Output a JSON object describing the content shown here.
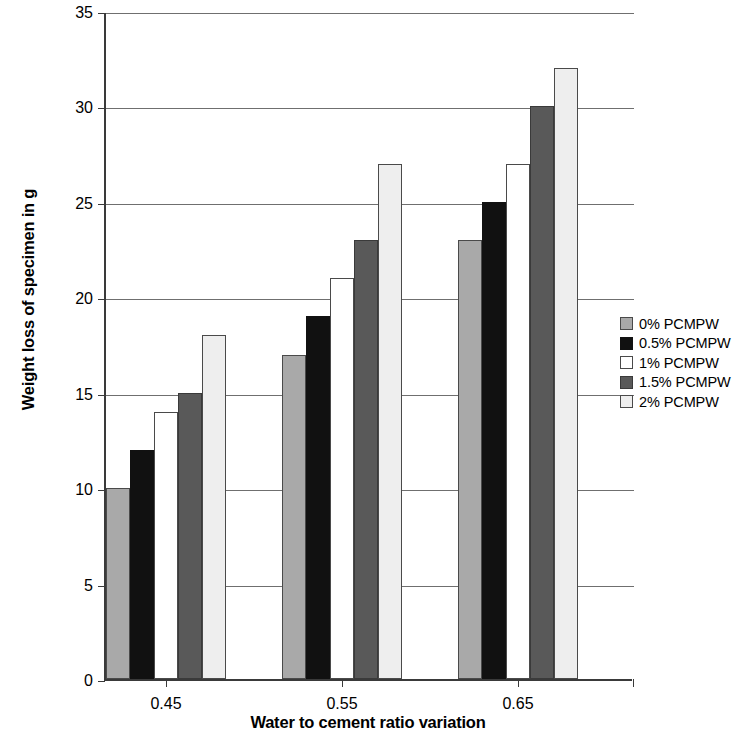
{
  "chart_data": {
    "type": "bar",
    "title": "",
    "xlabel": "Water to cement ratio variation",
    "ylabel": "Weight loss of specimen in g",
    "categories": [
      "0.45",
      "0.55",
      "0.65"
    ],
    "series": [
      {
        "name": "0% PCMPW",
        "values": [
          10,
          17,
          23
        ],
        "color": "#a9a9a9"
      },
      {
        "name": "0.5% PCMPW",
        "values": [
          12,
          19,
          25
        ],
        "color": "#111111"
      },
      {
        "name": "1% PCMPW",
        "values": [
          14,
          21,
          27
        ],
        "color": "#ffffff"
      },
      {
        "name": "1.5% PCMPW",
        "values": [
          15,
          23,
          30
        ],
        "color": "#595959"
      },
      {
        "name": "2% PCMPW",
        "values": [
          18,
          27,
          32
        ],
        "color": "#eeeeee"
      }
    ],
    "ylim": [
      0,
      35
    ],
    "y_ticks": [
      0,
      5,
      10,
      15,
      20,
      25,
      30,
      35
    ],
    "y_tick_labels": [
      "0",
      "5",
      "10",
      "15",
      "20",
      "25",
      "30",
      "35"
    ],
    "grid": true,
    "legend_position": "right"
  },
  "axes": {
    "y_title": "Weight loss of specimen in g",
    "x_title": "Water to cement ratio variation",
    "y_tick_labels": [
      "35",
      "30",
      "25",
      "20",
      "15",
      "10",
      "5",
      "0"
    ],
    "x_tick_labels": [
      "0.45",
      "0.55",
      "0.65"
    ]
  },
  "legend": {
    "items": [
      {
        "label": "0% PCMPW",
        "swatch": "sw-0"
      },
      {
        "label": "0.5% PCMPW",
        "swatch": "sw-05"
      },
      {
        "label": "1% PCMPW",
        "swatch": "sw-1"
      },
      {
        "label": "1.5% PCMPW",
        "swatch": "sw-15"
      },
      {
        "label": "2% PCMPW",
        "swatch": "sw-2"
      }
    ]
  }
}
